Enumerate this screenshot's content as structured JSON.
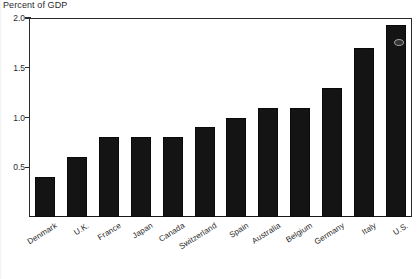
{
  "chart_data": {
    "type": "bar",
    "title": "",
    "ylabel": "Percent of GDP",
    "xlabel": "",
    "ylim": [
      0.0,
      2.0
    ],
    "yticks": [
      0.0,
      0.5,
      1.0,
      1.5,
      2.0
    ],
    "ytick_labels": [
      "",
      "0.5",
      "1.0",
      "1.5",
      "2.0"
    ],
    "grid": false,
    "legend": null,
    "bar_color": "#141414",
    "categories": [
      "Denmark",
      "U.K.",
      "France",
      "Japan",
      "Canada",
      "Switzerland",
      "Spain",
      "Australia",
      "Belgium",
      "Germany",
      "Italy",
      "U.S."
    ],
    "values": [
      0.4,
      0.6,
      0.8,
      0.8,
      0.8,
      0.9,
      1.0,
      1.1,
      1.1,
      1.3,
      1.7,
      1.93
    ],
    "series": [
      {
        "name": "Percent of GDP",
        "values": [
          0.4,
          0.6,
          0.8,
          0.8,
          0.8,
          0.9,
          1.0,
          1.1,
          1.1,
          1.3,
          1.7,
          1.93
        ]
      }
    ]
  },
  "axis": {
    "title_text": "Percent of GDP",
    "tick_labels": [
      "2.0",
      "1.5",
      "1.0",
      "0.5"
    ]
  },
  "categories": [
    {
      "label": "Denmark"
    },
    {
      "label": "U.K."
    },
    {
      "label": "France"
    },
    {
      "label": "Japan"
    },
    {
      "label": "Canada"
    },
    {
      "label": "Switzerland"
    },
    {
      "label": "Spain"
    },
    {
      "label": "Australia"
    },
    {
      "label": "Belgium"
    },
    {
      "label": "Germany"
    },
    {
      "label": "Italy"
    },
    {
      "label": "U.S."
    }
  ]
}
